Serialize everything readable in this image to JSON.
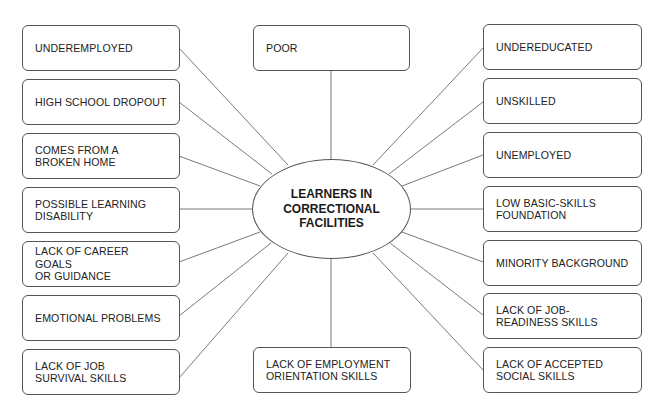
{
  "diagram": {
    "type": "spider-map",
    "center": {
      "label": "LEARNERS IN\nCORRECTIONAL\nFACILITIES"
    },
    "nodes": {
      "top_center": {
        "label": "POOR"
      },
      "bottom_center": {
        "label": "LACK OF EMPLOYMENT\nORIENTATION SKILLS"
      },
      "left": [
        {
          "label": "UNDEREMPLOYED"
        },
        {
          "label": "HIGH SCHOOL DROPOUT"
        },
        {
          "label": "COMES FROM A\nBROKEN HOME"
        },
        {
          "label": "POSSIBLE LEARNING\nDISABILITY"
        },
        {
          "label": "LACK OF CAREER GOALS\nOR GUIDANCE"
        },
        {
          "label": "EMOTIONAL PROBLEMS"
        },
        {
          "label": "LACK OF JOB\nSURVIVAL SKILLS"
        }
      ],
      "right": [
        {
          "label": "UNDEREDUCATED"
        },
        {
          "label": "UNSKILLED"
        },
        {
          "label": "UNEMPLOYED"
        },
        {
          "label": "LOW BASIC-SKILLS\nFOUNDATION"
        },
        {
          "label": "MINORITY BACKGROUND"
        },
        {
          "label": "LACK OF JOB-\nREADINESS SKILLS"
        },
        {
          "label": "LACK OF ACCEPTED\nSOCIAL SKILLS"
        }
      ]
    },
    "colors": {
      "stroke": "#555555",
      "text": "#222222",
      "background": "#ffffff"
    }
  }
}
